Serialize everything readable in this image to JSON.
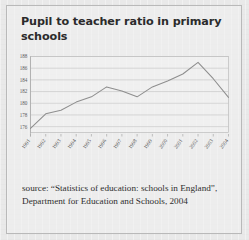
{
  "page": {
    "background_color": "#e9e9e9",
    "border_color": "#b9b9b9"
  },
  "title": "Pupil to teacher ratio in primary schools",
  "source": "source: “Statistics of education: schools in England”, Department for Education and Schools, 2004",
  "chart_data": {
    "type": "line",
    "title": "Pupil to teacher ratio in primary schools",
    "xlabel": "",
    "ylabel": "",
    "categories": [
      "1991",
      "1992",
      "1993",
      "1994",
      "1995",
      "1996",
      "1997",
      "1998",
      "1999",
      "2000",
      "2001",
      "2002",
      "2003",
      "2004"
    ],
    "values": [
      175.7,
      178.2,
      178.8,
      180.2,
      181.1,
      182.8,
      182.1,
      181.1,
      182.8,
      183.8,
      185.0,
      187.0,
      184.2,
      181.0
    ],
    "series": [
      {
        "name": "Pupil to teacher ratio",
        "values": [
          175.7,
          178.2,
          178.8,
          180.2,
          181.1,
          182.8,
          182.1,
          181.1,
          182.8,
          183.8,
          185.0,
          187.0,
          184.2,
          181.0
        ],
        "color": "#8e8e8e"
      }
    ],
    "ylim": [
      175,
      188
    ],
    "xlim": [
      1991,
      2004
    ],
    "yticks": [
      188,
      186,
      184,
      182,
      180,
      178,
      176
    ],
    "ytick_labels": [
      "188",
      "186",
      "184",
      "182",
      "180",
      "178",
      "176"
    ],
    "xtick_labels": [
      "1991",
      "1992",
      "1993",
      "1994",
      "1995",
      "1996",
      "1997",
      "1998",
      "1999",
      "2000",
      "2001",
      "2002",
      "2003",
      "2004"
    ],
    "grid": true,
    "gridline_color": "#c2c2c2",
    "legend": false,
    "legend_position": "none",
    "xtick_rotation": -55
  }
}
